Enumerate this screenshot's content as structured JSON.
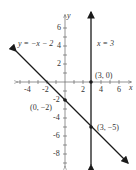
{
  "graph": {
    "x_axis_label": "x",
    "y_axis_label": "y",
    "x_ticks": [
      {
        "value": -4,
        "label": "-4"
      },
      {
        "value": -2,
        "label": "-2"
      },
      {
        "value": 2,
        "label": "2"
      },
      {
        "value": 4,
        "label": "4"
      },
      {
        "value": 6,
        "label": "6"
      }
    ],
    "y_ticks": [
      {
        "value": 6,
        "label": "6"
      },
      {
        "value": 4,
        "label": "4"
      },
      {
        "value": 2,
        "label": "2"
      },
      {
        "value": -2,
        "label": "-2"
      },
      {
        "value": -4,
        "label": "-4"
      },
      {
        "value": -6,
        "label": "-6"
      },
      {
        "value": -8,
        "label": "-8"
      }
    ],
    "lines": [
      {
        "equation": "y = -x - 2",
        "label": "y = −x − 2",
        "type": "slanted"
      },
      {
        "equation": "x = 3",
        "label": "x = 3",
        "type": "vertical"
      }
    ],
    "points": [
      {
        "label": "(3, 0)",
        "x": 3,
        "y": 0
      },
      {
        "label": "(0, −2)",
        "x": 0,
        "y": -2
      },
      {
        "label": "(3, −5)",
        "x": 3,
        "y": -5
      }
    ],
    "colors": {
      "line": "#1a1a1a",
      "axis": "#555555",
      "text": "#333333"
    }
  }
}
